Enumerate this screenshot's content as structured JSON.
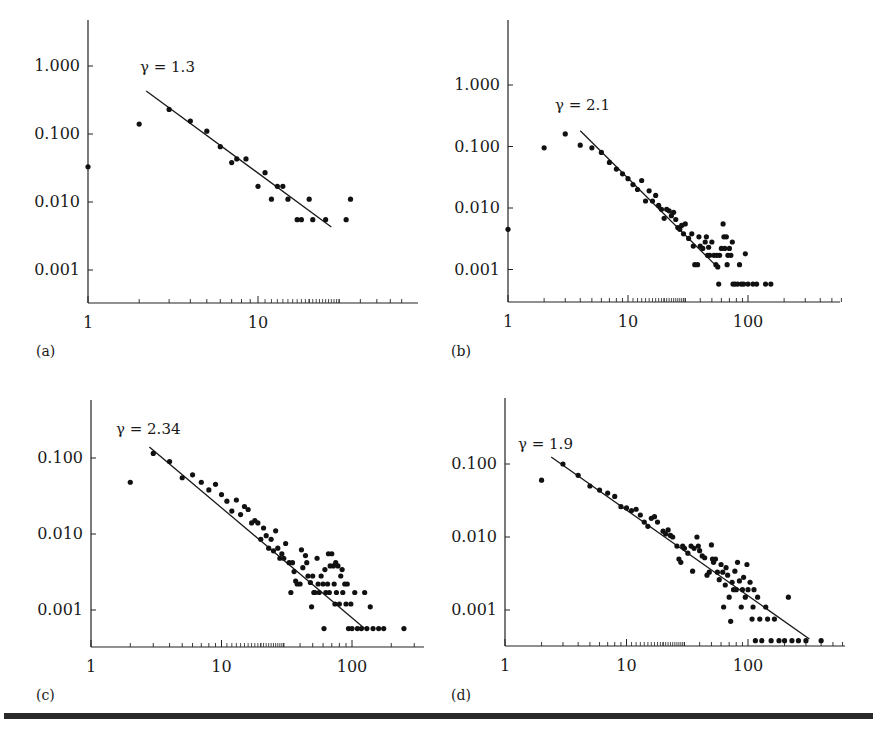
{
  "figure": {
    "panel_labels": [
      "(a)",
      "(b)",
      "(c)",
      "(d)"
    ]
  },
  "chart_data": [
    {
      "id": "a",
      "type": "scatter",
      "panel_label": "(a)",
      "annotation": "γ = 1.3",
      "xscale": "log",
      "yscale": "log",
      "xlim": [
        1,
        80
      ],
      "ylim": [
        0.0003,
        4.0
      ],
      "x_ticks": [
        1,
        10
      ],
      "x_tick_labels": [
        "1",
        "10"
      ],
      "y_ticks": [
        1.0,
        0.1,
        0.01,
        0.001
      ],
      "y_tick_labels": [
        "1.000",
        "0.100",
        "0.010",
        "0.001"
      ],
      "grid": false,
      "fit_line": {
        "slope": -1.3,
        "x": [
          2.2,
          27
        ],
        "y": [
          0.43,
          0.0043
        ]
      },
      "points": [
        [
          1,
          0.033
        ],
        [
          2,
          0.14
        ],
        [
          3,
          0.23
        ],
        [
          4,
          0.155
        ],
        [
          5,
          0.11
        ],
        [
          6,
          0.065
        ],
        [
          7,
          0.038
        ],
        [
          7.5,
          0.043
        ],
        [
          8.5,
          0.043
        ],
        [
          10,
          0.017
        ],
        [
          11,
          0.027
        ],
        [
          12,
          0.011
        ],
        [
          13,
          0.017
        ],
        [
          14,
          0.017
        ],
        [
          15,
          0.011
        ],
        [
          17,
          0.0055
        ],
        [
          18,
          0.0055
        ],
        [
          20,
          0.011
        ],
        [
          21,
          0.0055
        ],
        [
          25,
          0.0055
        ],
        [
          33,
          0.0055
        ],
        [
          35,
          0.011
        ]
      ]
    },
    {
      "id": "b",
      "type": "scatter",
      "panel_label": "(b)",
      "annotation": "γ = 2.1",
      "xscale": "log",
      "yscale": "log",
      "xlim": [
        1,
        700
      ],
      "ylim": [
        0.00028,
        5.0
      ],
      "x_ticks": [
        1,
        10,
        100
      ],
      "x_tick_labels": [
        "1",
        "10",
        "100"
      ],
      "y_ticks": [
        1.0,
        0.1,
        0.01,
        0.001
      ],
      "y_tick_labels": [
        "1.000",
        "0.100",
        "0.010",
        "0.001"
      ],
      "grid": false,
      "fit_line": {
        "slope": -2.1,
        "x": [
          4,
          53
        ],
        "y": [
          0.18,
          0.0012
        ]
      },
      "points": [
        [
          1,
          0.0045
        ],
        [
          2,
          0.095
        ],
        [
          3,
          0.16
        ],
        [
          4,
          0.105
        ],
        [
          5,
          0.095
        ],
        [
          6,
          0.08
        ],
        [
          7,
          0.055
        ],
        [
          8,
          0.043
        ],
        [
          9,
          0.036
        ],
        [
          10,
          0.03
        ],
        [
          11,
          0.024
        ],
        [
          12,
          0.02
        ],
        [
          13,
          0.028
        ],
        [
          14,
          0.013
        ],
        [
          15,
          0.019
        ],
        [
          16,
          0.013
        ],
        [
          17,
          0.016
        ],
        [
          18,
          0.011
        ],
        [
          19,
          0.0095
        ],
        [
          20,
          0.0068
        ],
        [
          21,
          0.0095
        ],
        [
          22,
          0.009
        ],
        [
          23,
          0.0075
        ],
        [
          24,
          0.0085
        ],
        [
          25,
          0.0065
        ],
        [
          26,
          0.0048
        ],
        [
          27,
          0.0045
        ],
        [
          28,
          0.0052
        ],
        [
          29,
          0.0038
        ],
        [
          30,
          0.0055
        ],
        [
          32,
          0.0032
        ],
        [
          34,
          0.0038
        ],
        [
          35,
          0.0024
        ],
        [
          36,
          0.0012
        ],
        [
          38,
          0.0012
        ],
        [
          39,
          0.0034
        ],
        [
          40,
          0.0024
        ],
        [
          42,
          0.0022
        ],
        [
          44,
          0.0028
        ],
        [
          45,
          0.0034
        ],
        [
          46,
          0.0017
        ],
        [
          47,
          0.0023
        ],
        [
          48,
          0.0017
        ],
        [
          50,
          0.0028
        ],
        [
          52,
          0.0017
        ],
        [
          54,
          0.0012
        ],
        [
          55,
          0.0017
        ],
        [
          56,
          0.0011
        ],
        [
          57,
          0.00058
        ],
        [
          58,
          0.0017
        ],
        [
          60,
          0.0022
        ],
        [
          62,
          0.0055
        ],
        [
          63,
          0.0034
        ],
        [
          64,
          0.0022
        ],
        [
          66,
          0.0034
        ],
        [
          67,
          0.0012
        ],
        [
          68,
          0.0017
        ],
        [
          70,
          0.0022
        ],
        [
          72,
          0.0017
        ],
        [
          74,
          0.0028
        ],
        [
          75,
          0.00058
        ],
        [
          78,
          0.00058
        ],
        [
          82,
          0.00058
        ],
        [
          85,
          0.0012
        ],
        [
          88,
          0.00058
        ],
        [
          92,
          0.00058
        ],
        [
          95,
          0.0018
        ],
        [
          100,
          0.00058
        ],
        [
          110,
          0.00058
        ],
        [
          118,
          0.00058
        ],
        [
          140,
          0.00058
        ],
        [
          155,
          0.00058
        ]
      ]
    },
    {
      "id": "c",
      "type": "scatter",
      "panel_label": "(c)",
      "annotation": "γ = 2.34",
      "xscale": "log",
      "yscale": "log",
      "xlim": [
        1,
        400
      ],
      "ylim": [
        0.00032,
        0.45
      ],
      "x_ticks": [
        1,
        10,
        100
      ],
      "x_tick_labels": [
        "1",
        "10",
        "100"
      ],
      "y_ticks": [
        0.1,
        0.01,
        0.001
      ],
      "y_tick_labels": [
        "0.100",
        "0.010",
        "0.001"
      ],
      "grid": false,
      "fit_line": {
        "slope": -2.34,
        "x": [
          2.8,
          125
        ],
        "y": [
          0.14,
          0.00057
        ]
      },
      "points": [
        [
          2,
          0.048
        ],
        [
          3,
          0.115
        ],
        [
          4,
          0.09
        ],
        [
          5,
          0.055
        ],
        [
          6,
          0.06
        ],
        [
          7,
          0.048
        ],
        [
          8,
          0.038
        ],
        [
          9,
          0.045
        ],
        [
          10,
          0.033
        ],
        [
          11,
          0.027
        ],
        [
          12,
          0.02
        ],
        [
          13,
          0.028
        ],
        [
          14,
          0.018
        ],
        [
          15,
          0.023
        ],
        [
          16,
          0.021
        ],
        [
          17,
          0.014
        ],
        [
          18,
          0.015
        ],
        [
          19,
          0.014
        ],
        [
          20,
          0.0085
        ],
        [
          21,
          0.012
        ],
        [
          22,
          0.0095
        ],
        [
          23,
          0.0065
        ],
        [
          24,
          0.0085
        ],
        [
          25,
          0.006
        ],
        [
          26,
          0.011
        ],
        [
          27,
          0.0065
        ],
        [
          28,
          0.0048
        ],
        [
          29,
          0.0055
        ],
        [
          30,
          0.0048
        ],
        [
          31,
          0.0075
        ],
        [
          33,
          0.0042
        ],
        [
          34,
          0.0017
        ],
        [
          35,
          0.0042
        ],
        [
          36,
          0.0032
        ],
        [
          37,
          0.0024
        ],
        [
          38,
          0.0022
        ],
        [
          40,
          0.0022
        ],
        [
          41,
          0.0062
        ],
        [
          42,
          0.0036
        ],
        [
          44,
          0.0052
        ],
        [
          45,
          0.0042
        ],
        [
          46,
          0.0028
        ],
        [
          48,
          0.0023
        ],
        [
          49,
          0.0011
        ],
        [
          50,
          0.0028
        ],
        [
          51,
          0.0017
        ],
        [
          52,
          0.0017
        ],
        [
          54,
          0.0048
        ],
        [
          55,
          0.0022
        ],
        [
          56,
          0.0017
        ],
        [
          58,
          0.0028
        ],
        [
          60,
          0.0022
        ],
        [
          61,
          0.00057
        ],
        [
          62,
          0.0034
        ],
        [
          63,
          0.0017
        ],
        [
          65,
          0.0022
        ],
        [
          66,
          0.0055
        ],
        [
          67,
          0.0017
        ],
        [
          68,
          0.0038
        ],
        [
          70,
          0.0055
        ],
        [
          72,
          0.0038
        ],
        [
          73,
          0.0022
        ],
        [
          74,
          0.0012
        ],
        [
          75,
          0.0042
        ],
        [
          76,
          0.0017
        ],
        [
          78,
          0.0038
        ],
        [
          80,
          0.0012
        ],
        [
          82,
          0.0028
        ],
        [
          84,
          0.0034
        ],
        [
          85,
          0.0017
        ],
        [
          88,
          0.0022
        ],
        [
          90,
          0.0012
        ],
        [
          92,
          0.0022
        ],
        [
          94,
          0.00057
        ],
        [
          98,
          0.0012
        ],
        [
          100,
          0.00057
        ],
        [
          105,
          0.0017
        ],
        [
          110,
          0.00057
        ],
        [
          118,
          0.00057
        ],
        [
          125,
          0.0017
        ],
        [
          130,
          0.00057
        ],
        [
          138,
          0.0011
        ],
        [
          145,
          0.00057
        ],
        [
          160,
          0.00057
        ],
        [
          175,
          0.00057
        ],
        [
          250,
          0.00057
        ]
      ]
    },
    {
      "id": "d",
      "type": "scatter",
      "panel_label": "(d)",
      "annotation": "γ = 1.9",
      "xscale": "log",
      "yscale": "log",
      "xlim": [
        1,
        700
      ],
      "ylim": [
        0.00032,
        0.55
      ],
      "x_ticks": [
        1,
        10,
        100
      ],
      "x_tick_labels": [
        "1",
        "10",
        "100"
      ],
      "y_ticks": [
        0.1,
        0.01,
        0.001
      ],
      "y_tick_labels": [
        "0.100",
        "0.010",
        "0.001"
      ],
      "grid": false,
      "fit_line": {
        "slope": -1.9,
        "x": [
          2.4,
          320
        ],
        "y": [
          0.125,
          0.0004
        ]
      },
      "points": [
        [
          2,
          0.06
        ],
        [
          3,
          0.1
        ],
        [
          4,
          0.07
        ],
        [
          5,
          0.05
        ],
        [
          6,
          0.044
        ],
        [
          7,
          0.04
        ],
        [
          8,
          0.036
        ],
        [
          9,
          0.026
        ],
        [
          10,
          0.025
        ],
        [
          11,
          0.023
        ],
        [
          12,
          0.024
        ],
        [
          13,
          0.02
        ],
        [
          14,
          0.016
        ],
        [
          15,
          0.014
        ],
        [
          16,
          0.018
        ],
        [
          17,
          0.019
        ],
        [
          18,
          0.016
        ],
        [
          20,
          0.012
        ],
        [
          21,
          0.011
        ],
        [
          22,
          0.0125
        ],
        [
          23,
          0.0105
        ],
        [
          24,
          0.01
        ],
        [
          26,
          0.0075
        ],
        [
          27,
          0.005
        ],
        [
          28,
          0.0045
        ],
        [
          29,
          0.0075
        ],
        [
          30,
          0.007
        ],
        [
          32,
          0.006
        ],
        [
          34,
          0.0075
        ],
        [
          35,
          0.0034
        ],
        [
          36,
          0.007
        ],
        [
          38,
          0.01
        ],
        [
          39,
          0.0075
        ],
        [
          40,
          0.0065
        ],
        [
          42,
          0.0055
        ],
        [
          44,
          0.0052
        ],
        [
          46,
          0.003
        ],
        [
          48,
          0.0033
        ],
        [
          50,
          0.0078
        ],
        [
          51,
          0.005
        ],
        [
          52,
          0.0045
        ],
        [
          54,
          0.005
        ],
        [
          56,
          0.0033
        ],
        [
          58,
          0.0026
        ],
        [
          60,
          0.0042
        ],
        [
          62,
          0.0033
        ],
        [
          63,
          0.0011
        ],
        [
          65,
          0.0022
        ],
        [
          66,
          0.0038
        ],
        [
          68,
          0.003
        ],
        [
          70,
          0.0015
        ],
        [
          72,
          0.0007
        ],
        [
          74,
          0.0024
        ],
        [
          76,
          0.0019
        ],
        [
          78,
          0.0034
        ],
        [
          80,
          0.0019
        ],
        [
          82,
          0.0045
        ],
        [
          85,
          0.0025
        ],
        [
          88,
          0.0011
        ],
        [
          90,
          0.0019
        ],
        [
          92,
          0.0028
        ],
        [
          95,
          0.0015
        ],
        [
          98,
          0.0042
        ],
        [
          100,
          0.0019
        ],
        [
          104,
          0.0024
        ],
        [
          108,
          0.00075
        ],
        [
          110,
          0.0011
        ],
        [
          112,
          0.0019
        ],
        [
          115,
          0.00038
        ],
        [
          120,
          0.0015
        ],
        [
          125,
          0.00075
        ],
        [
          130,
          0.00038
        ],
        [
          140,
          0.0011
        ],
        [
          145,
          0.00075
        ],
        [
          155,
          0.00038
        ],
        [
          165,
          0.00075
        ],
        [
          180,
          0.00038
        ],
        [
          200,
          0.00038
        ],
        [
          215,
          0.0015
        ],
        [
          230,
          0.00038
        ],
        [
          260,
          0.00038
        ],
        [
          300,
          0.00038
        ],
        [
          400,
          0.00038
        ]
      ]
    }
  ],
  "layout": {
    "panels": {
      "a": {
        "x0": 88,
        "x1": 418,
        "yAxisTop": 20,
        "xAxisY": 303,
        "xDec": 170,
        "yTopVal": 1.0,
        "yTopPx": 66,
        "yDec": 68,
        "labelY": 356
      },
      "b": {
        "x0": 508,
        "x1": 840,
        "yAxisTop": 20,
        "xAxisY": 302,
        "xDec": 120,
        "yTopVal": 1.0,
        "yTopPx": 85,
        "yDec": 61.5,
        "labelY": 356
      },
      "c": {
        "x0": 91,
        "x1": 424,
        "yAxisTop": 400,
        "xAxisY": 647,
        "xDec": 130.5,
        "yTopVal": 0.1,
        "yTopPx": 458,
        "yDec": 76,
        "labelY": 700
      },
      "d": {
        "x0": 505,
        "x1": 845,
        "yAxisTop": 398,
        "xAxisY": 646,
        "xDec": 121.5,
        "yTopVal": 0.1,
        "yTopPx": 464,
        "yDec": 73,
        "labelY": 700
      }
    },
    "labelX": {
      "a": 36,
      "b": 451,
      "c": 36,
      "d": 451
    },
    "annotationPos": {
      "a": [
        140,
        72
      ],
      "b": [
        555,
        110
      ],
      "c": [
        116,
        434
      ],
      "d": [
        518,
        449
      ]
    }
  }
}
